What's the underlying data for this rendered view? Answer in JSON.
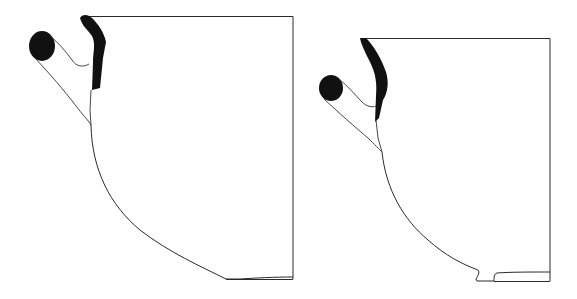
{
  "figure": {
    "background": "#ffffff",
    "ink_color": "#111111",
    "vessels": [
      {
        "id": "vessel-1",
        "label": "",
        "rim_y": 16,
        "rim_x_start": 84,
        "rim_x_end": 293,
        "base_y": 279,
        "base_x_start": 226,
        "base_x_end": 293,
        "has_foot_ring": false,
        "handle": "loop handle, black section"
      },
      {
        "id": "vessel-2",
        "label": "",
        "rim_y": 38,
        "rim_x_start": 361,
        "rim_x_end": 550,
        "base_y": 281,
        "base_x_start": 476,
        "base_x_end": 550,
        "has_foot_ring": true,
        "handle": "loop handle, black section"
      }
    ]
  }
}
